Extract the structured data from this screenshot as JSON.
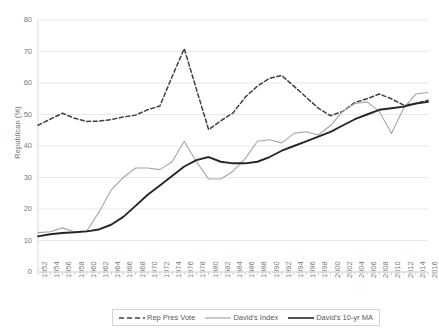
{
  "chart_data": {
    "type": "line",
    "title": "",
    "subtitle": "",
    "xlabel": "",
    "ylabel": "Republican (%)",
    "xlim": [
      1952,
      2016
    ],
    "ylim": [
      0,
      80
    ],
    "ytick_step": 10,
    "xtick_step": 2,
    "grid": "horizontal",
    "legend_position": "bottom",
    "categories": [
      1952,
      1954,
      1956,
      1958,
      1960,
      1962,
      1964,
      1966,
      1968,
      1970,
      1972,
      1974,
      1976,
      1978,
      1980,
      1982,
      1984,
      1986,
      1988,
      1990,
      1992,
      1994,
      1996,
      1998,
      2000,
      2002,
      2004,
      2006,
      2008,
      2010,
      2012,
      2014,
      2016
    ],
    "yticks": [
      0,
      10,
      20,
      30,
      40,
      50,
      60,
      70,
      80
    ],
    "xticks": [
      "1952",
      "1954",
      "1956",
      "1958",
      "1960",
      "1962",
      "1964",
      "1966",
      "1968",
      "1970",
      "1972",
      "1974",
      "1976",
      "1978",
      "1980",
      "1982",
      "1984",
      "1986",
      "1988",
      "1990",
      "1992",
      "1994",
      "1996",
      "1998",
      "2000",
      "2002",
      "2004",
      "2006",
      "2008",
      "2010",
      "2012",
      "2014",
      "2016"
    ],
    "series": [
      {
        "name": "Rep Pres Vote",
        "style": "dashed",
        "color": "#404040",
        "x": [
          1952,
          1954,
          1956,
          1958,
          1960,
          1962,
          1964,
          1966,
          1968,
          1970,
          1972,
          1974,
          1976,
          1978,
          1980,
          1982,
          1984,
          1986,
          1988,
          1990,
          1992,
          1994,
          1996,
          1998,
          2000,
          2002,
          2004,
          2006,
          2008,
          2010,
          2012,
          2014,
          2016
        ],
        "values": [
          46.6,
          48.5,
          50.4,
          48.8,
          47.8,
          47.9,
          48.4,
          49.2,
          49.8,
          51.5,
          52.7,
          62.0,
          70.9,
          58.0,
          45.2,
          48.0,
          50.5,
          55.5,
          59.0,
          61.5,
          62.4,
          59.0,
          55.5,
          52.0,
          49.6,
          51.0,
          53.8,
          55.0,
          56.5,
          55.0,
          53.0,
          53.5,
          54.5
        ]
      },
      {
        "name": "David's Index",
        "style": "solid",
        "color": "#a6a6a6",
        "x": [
          1952,
          1954,
          1956,
          1958,
          1960,
          1962,
          1964,
          1966,
          1968,
          1970,
          1972,
          1974,
          1976,
          1978,
          1980,
          1982,
          1984,
          1986,
          1988,
          1990,
          1992,
          1994,
          1996,
          1998,
          2000,
          2002,
          2004,
          2006,
          2008,
          2010,
          2012,
          2014,
          2016
        ],
        "values": [
          12.5,
          12.8,
          14.0,
          12.8,
          13.0,
          19.0,
          26.0,
          30.0,
          33.0,
          33.0,
          32.5,
          35.0,
          41.5,
          35.0,
          29.5,
          29.5,
          32.0,
          36.0,
          41.5,
          42.0,
          41.0,
          44.0,
          44.5,
          43.5,
          46.5,
          51.0,
          53.5,
          54.0,
          51.0,
          44.0,
          52.0,
          56.5,
          57.0
        ]
      },
      {
        "name": "David's 10-yr MA",
        "style": "solid",
        "color": "#262626",
        "x": [
          1952,
          1954,
          1956,
          1958,
          1960,
          1962,
          1964,
          1966,
          1968,
          1970,
          1972,
          1974,
          1976,
          1978,
          1980,
          1982,
          1984,
          1986,
          1988,
          1990,
          1992,
          1994,
          1996,
          1998,
          2000,
          2002,
          2004,
          2006,
          2008,
          2010,
          2012,
          2014,
          2016
        ],
        "values": [
          11.3,
          12.0,
          12.4,
          12.6,
          12.9,
          13.5,
          15.0,
          17.5,
          21.0,
          24.5,
          27.5,
          30.5,
          33.5,
          35.5,
          36.5,
          35.0,
          34.5,
          34.5,
          35.0,
          36.5,
          38.5,
          40.0,
          41.5,
          43.0,
          44.5,
          46.5,
          48.5,
          50.0,
          51.5,
          52.0,
          52.5,
          53.5,
          54.0
        ]
      }
    ]
  },
  "legend": {
    "items": [
      {
        "label": "Rep Pres Vote"
      },
      {
        "label": "David's Index"
      },
      {
        "label": "David's 10-yr MA"
      }
    ]
  },
  "colors": {
    "rep_pres_vote": "#404040",
    "davids_index": "#a6a6a6",
    "davids_10yr_ma": "#262626",
    "gridline": "#e8e8e8",
    "tick_text": "#7a7a7a"
  }
}
